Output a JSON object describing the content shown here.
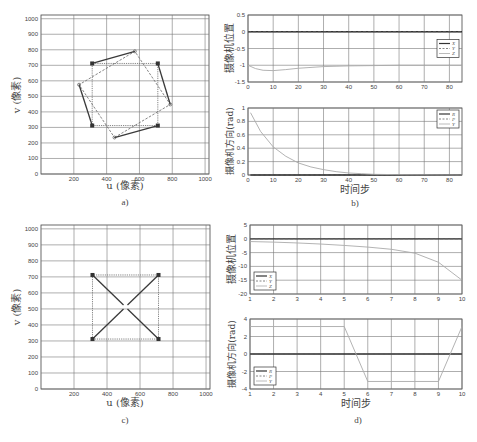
{
  "figure": {
    "panels": [
      {
        "id": "a",
        "caption": "a)"
      },
      {
        "id": "b",
        "caption": "b)"
      },
      {
        "id": "c",
        "caption": "c)"
      },
      {
        "id": "d",
        "caption": "d)"
      }
    ]
  },
  "chart_data": [
    {
      "panel": "a",
      "type": "scatter",
      "title": "",
      "xlabel": "u (像素)",
      "ylabel": "v (像素)",
      "xlim": [
        0,
        1024
      ],
      "ylim": [
        1024,
        0
      ],
      "xticks": [
        200,
        400,
        600,
        800,
        1000
      ],
      "yticks": [
        0,
        100,
        200,
        300,
        400,
        500,
        600,
        700,
        800,
        900,
        1000
      ],
      "grid": true,
      "series": [
        {
          "name": "desired",
          "style": "dotted-square",
          "points": [
            [
              312,
              312
            ],
            [
              712,
              312
            ],
            [
              712,
              712
            ],
            [
              312,
              712
            ]
          ]
        },
        {
          "name": "current",
          "style": "dashed-rotated-square",
          "points": [
            [
              448,
              235
            ],
            [
              788,
              448
            ],
            [
              572,
              790
            ],
            [
              232,
              575
            ]
          ]
        },
        {
          "name": "trajectories",
          "style": "solid",
          "segments": [
            [
              [
                312,
                312
              ],
              [
                232,
                575
              ]
            ],
            [
              [
                712,
                312
              ],
              [
                448,
                235
              ]
            ],
            [
              [
                712,
                712
              ],
              [
                788,
                448
              ]
            ],
            [
              [
                312,
                712
              ],
              [
                572,
                790
              ]
            ]
          ]
        }
      ]
    },
    {
      "panel": "b-top",
      "type": "line",
      "xlabel": "",
      "ylabel": "摄像机位置",
      "xlim": [
        0,
        85
      ],
      "ylim": [
        -1.5,
        0.5
      ],
      "xticks": [
        0,
        10,
        20,
        30,
        40,
        50,
        60,
        70,
        80
      ],
      "yticks": [
        0.5,
        0,
        -0.5,
        -1,
        -1.5
      ],
      "ytick_labels": [
        "0.5",
        "0",
        "-0.5",
        "-1",
        "-1.5"
      ],
      "grid": true,
      "legend": {
        "position": "right",
        "entries": [
          "X",
          "Y",
          "Z"
        ]
      },
      "x": [
        0,
        3,
        6,
        10,
        15,
        20,
        30,
        40,
        50,
        60,
        70,
        85
      ],
      "series": [
        {
          "name": "X",
          "style": "solid-dark",
          "values": [
            0,
            0,
            0,
            0,
            0,
            0,
            0,
            0,
            0,
            0,
            0,
            0
          ]
        },
        {
          "name": "Y",
          "style": "dashed",
          "values": [
            0,
            0,
            0,
            0,
            0,
            0,
            0,
            0,
            0,
            0,
            0,
            0
          ]
        },
        {
          "name": "Z",
          "style": "solid-light",
          "values": [
            -1.0,
            -1.1,
            -1.15,
            -1.16,
            -1.13,
            -1.09,
            -1.04,
            -1.02,
            -1.01,
            -1.0,
            -1.0,
            -1.0
          ]
        }
      ]
    },
    {
      "panel": "b-bottom",
      "type": "line",
      "xlabel": "时间步",
      "ylabel": "摄像机方向(rad)",
      "xlim": [
        0,
        85
      ],
      "ylim": [
        0,
        1
      ],
      "xticks": [
        0,
        10,
        20,
        30,
        40,
        50,
        60,
        70,
        80
      ],
      "yticks": [
        1,
        0.8,
        0.6,
        0.4,
        0.2,
        0
      ],
      "ytick_labels": [
        "1",
        "0.8",
        "0.6",
        "0.4",
        "0.2",
        "0"
      ],
      "grid": true,
      "legend": {
        "position": "top-right",
        "entries": [
          "R",
          "P",
          "Y"
        ]
      },
      "x": [
        1,
        5,
        10,
        15,
        20,
        25,
        30,
        35,
        40,
        45,
        50,
        60,
        85
      ],
      "series": [
        {
          "name": "R",
          "style": "solid-dark",
          "values": [
            0,
            0,
            0,
            0,
            0,
            0,
            0,
            0,
            0,
            0,
            0,
            0,
            0
          ]
        },
        {
          "name": "P",
          "style": "dashed",
          "values": [
            0,
            0,
            0,
            0,
            0,
            0,
            0,
            0,
            0,
            0,
            0,
            0,
            0
          ]
        },
        {
          "name": "Y",
          "style": "solid-light",
          "values": [
            0.93,
            0.65,
            0.42,
            0.28,
            0.18,
            0.12,
            0.08,
            0.05,
            0.03,
            0.02,
            0.01,
            0.005,
            0
          ]
        }
      ]
    },
    {
      "panel": "c",
      "type": "scatter",
      "xlabel": "u (像素)",
      "ylabel": "v (像素)",
      "xlim": [
        0,
        1024
      ],
      "ylim": [
        1024,
        0
      ],
      "xticks": [
        200,
        400,
        600,
        800,
        1000
      ],
      "yticks": [
        0,
        100,
        200,
        300,
        400,
        500,
        600,
        700,
        800,
        900,
        1000
      ],
      "grid": true,
      "series": [
        {
          "name": "desired",
          "style": "dotted-square",
          "points": [
            [
              312,
              312
            ],
            [
              712,
              312
            ],
            [
              712,
              712
            ],
            [
              312,
              712
            ]
          ]
        },
        {
          "name": "trajectories",
          "style": "solid",
          "segments": [
            [
              [
                312,
                312
              ],
              [
                500,
                500
              ]
            ],
            [
              [
                712,
                312
              ],
              [
                524,
                500
              ]
            ],
            [
              [
                712,
                712
              ],
              [
                524,
                524
              ]
            ],
            [
              [
                312,
                712
              ],
              [
                500,
                524
              ]
            ]
          ]
        }
      ]
    },
    {
      "panel": "d-top",
      "type": "line",
      "xlabel": "",
      "ylabel": "摄像机位置",
      "xlim": [
        1,
        10
      ],
      "ylim": [
        -20,
        5
      ],
      "xticks": [
        1,
        2,
        3,
        4,
        5,
        6,
        7,
        8,
        9,
        10
      ],
      "yticks": [
        5,
        0,
        -5,
        -10,
        -15,
        -20
      ],
      "ytick_labels": [
        "5",
        "0",
        "-5",
        "-10",
        "-15",
        "-20"
      ],
      "grid": true,
      "legend": {
        "position": "bottom-left",
        "entries": [
          "X",
          "Y",
          "Z"
        ]
      },
      "x": [
        1,
        2,
        3,
        4,
        5,
        6,
        7,
        8,
        9,
        10
      ],
      "series": [
        {
          "name": "X",
          "style": "solid-dark",
          "values": [
            0,
            0,
            0,
            0,
            0,
            0,
            0,
            0,
            0,
            0
          ]
        },
        {
          "name": "Y",
          "style": "dashed",
          "values": [
            0,
            0,
            0,
            0,
            0,
            0,
            0,
            0,
            0,
            0
          ]
        },
        {
          "name": "Z",
          "style": "solid-light",
          "values": [
            -1,
            -1.2,
            -1.5,
            -1.9,
            -2.4,
            -3.0,
            -3.8,
            -5.2,
            -8.5,
            -15
          ]
        }
      ]
    },
    {
      "panel": "d-bottom",
      "type": "line",
      "xlabel": "时间步",
      "ylabel": "摄像机方向(rad)",
      "xlim": [
        1,
        10
      ],
      "ylim": [
        -4,
        4
      ],
      "xticks": [
        1,
        2,
        3,
        4,
        5,
        6,
        7,
        8,
        9,
        10
      ],
      "yticks": [
        4,
        2,
        0,
        -2,
        -4
      ],
      "ytick_labels": [
        "4",
        "2",
        "0",
        "-2",
        "-4"
      ],
      "grid": true,
      "legend": {
        "position": "bottom-left",
        "entries": [
          "R",
          "P",
          "Y"
        ]
      },
      "x": [
        1,
        2,
        3,
        4,
        5,
        6,
        7,
        8,
        9,
        10
      ],
      "series": [
        {
          "name": "R",
          "style": "solid-dark",
          "values": [
            0,
            0,
            0,
            0,
            0,
            0,
            0,
            0,
            0,
            0
          ]
        },
        {
          "name": "P",
          "style": "dashed",
          "values": [
            0,
            0,
            0,
            0,
            0,
            0,
            0,
            0,
            0,
            0
          ]
        },
        {
          "name": "Y",
          "style": "solid-light",
          "values": [
            3.14,
            3.14,
            3.14,
            3.14,
            3.14,
            -3.14,
            -3.14,
            -3.14,
            -3.14,
            3.14
          ]
        }
      ]
    }
  ]
}
